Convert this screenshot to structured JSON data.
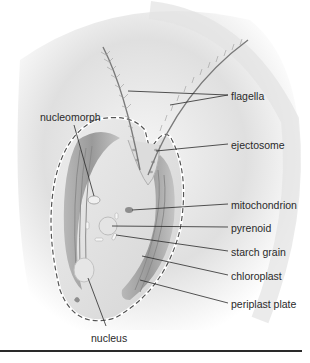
{
  "diagram": {
    "labels": [
      {
        "id": "flagella",
        "text": "flagella",
        "x": 231,
        "y": 90
      },
      {
        "id": "nucleomorph",
        "text": "nucleomorph",
        "x": 40,
        "y": 111
      },
      {
        "id": "ejectosome",
        "text": "ejectosome",
        "x": 231,
        "y": 139
      },
      {
        "id": "mitochondrion",
        "text": "mitochondrion",
        "x": 231,
        "y": 199
      },
      {
        "id": "pyrenoid",
        "text": "pyrenoid",
        "x": 231,
        "y": 222
      },
      {
        "id": "starch-grain",
        "text": "starch grain",
        "x": 231,
        "y": 246
      },
      {
        "id": "chloroplast",
        "text": "chloroplast",
        "x": 231,
        "y": 270
      },
      {
        "id": "periplast-plate",
        "text": "periplast plate",
        "x": 231,
        "y": 298
      },
      {
        "id": "nucleus",
        "text": "nucleus",
        "x": 91,
        "y": 332
      }
    ],
    "colors": {
      "background": "#ffffff",
      "shading": "#d8d8d8",
      "cell_fill": "#e6e6e6",
      "cell_outline": "#555555",
      "leader_line": "#2a2a2a",
      "label_text": "#2a2a2a"
    }
  }
}
